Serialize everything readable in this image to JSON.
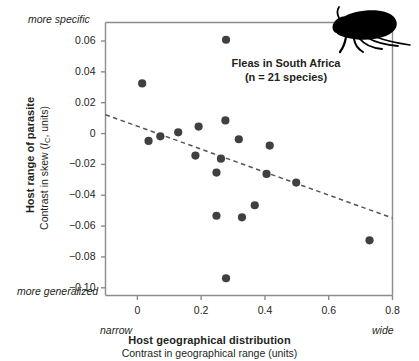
{
  "annotation": {
    "line1": "Fleas in South Africa",
    "line2": "(n = 21 species)"
  },
  "axes": {
    "x_title": "Host geographical distribution",
    "x_subtitle": "Contrast in geographical range (units)",
    "y_title": "Host range of parasite",
    "y_subtitle_prefix": "Contrast in skew (",
    "y_subtitle_symbol": "I",
    "y_subtitle_sub": "C",
    "y_subtitle_suffix": ", units)",
    "anchor_top_left": "more specific",
    "anchor_bottom_left": "more generalized",
    "anchor_bottom_start": "narrow",
    "anchor_bottom_end": "wide"
  },
  "colors": {
    "marker": "#404043",
    "axis": "#8c8c8c",
    "trend": "#555558",
    "text": "#231f20",
    "flea": "#000000"
  },
  "chart_data": {
    "type": "scatter",
    "title": "Fleas in South Africa",
    "subtitle": "(n = 21 species)",
    "xlabel": "Host geographical distribution",
    "xlabel_sub": "Contrast in geographical range (units)",
    "ylabel": "Host range of parasite",
    "ylabel_sub": "Contrast in skew (IC, units)",
    "xlim": [
      -0.1,
      0.8
    ],
    "ylim": [
      -0.105,
      0.072
    ],
    "xticks": [
      0,
      0.2,
      0.4,
      0.6,
      0.8
    ],
    "xtick_labels": [
      "0",
      "0.2",
      "0.4",
      "0.6",
      "0.8"
    ],
    "yticks": [
      0.06,
      0.04,
      0.02,
      0,
      -0.02,
      -0.04,
      -0.06,
      -0.08,
      -0.1
    ],
    "ytick_labels": [
      "0.06",
      "0.04",
      "0.02",
      "0",
      "−0.02",
      "−0.04",
      "−0.06",
      "−0.08",
      "−0.10"
    ],
    "grid": false,
    "legend": null,
    "n_points": 21,
    "points": [
      {
        "x": 0.015,
        "y": 0.0325
      },
      {
        "x": 0.035,
        "y": -0.0048
      },
      {
        "x": 0.072,
        "y": -0.0018
      },
      {
        "x": 0.128,
        "y": 0.0008
      },
      {
        "x": 0.182,
        "y": -0.0143
      },
      {
        "x": 0.192,
        "y": 0.0045
      },
      {
        "x": 0.248,
        "y": -0.0253
      },
      {
        "x": 0.248,
        "y": -0.0533
      },
      {
        "x": 0.262,
        "y": -0.0163
      },
      {
        "x": 0.276,
        "y": 0.0085
      },
      {
        "x": 0.278,
        "y": 0.0608
      },
      {
        "x": 0.278,
        "y": -0.0938
      },
      {
        "x": 0.318,
        "y": -0.0037
      },
      {
        "x": 0.328,
        "y": -0.0543
      },
      {
        "x": 0.368,
        "y": -0.0465
      },
      {
        "x": 0.405,
        "y": -0.0262
      },
      {
        "x": 0.415,
        "y": -0.0078
      },
      {
        "x": 0.498,
        "y": -0.0318
      },
      {
        "x": 0.728,
        "y": -0.0692
      }
    ],
    "trendline": {
      "style": "dashed",
      "x0": -0.1,
      "y0": 0.0122,
      "x1": 0.8,
      "y1": -0.0548
    }
  }
}
